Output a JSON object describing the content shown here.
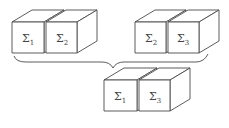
{
  "diagram": {
    "stroke_color": "#4a4a4a",
    "background": "#ffffff",
    "groups": [
      {
        "name": "top-left-pair",
        "cubes": [
          {
            "label": "Σ",
            "subscript": "1"
          },
          {
            "label": "Σ",
            "subscript": "2"
          }
        ]
      },
      {
        "name": "top-right-pair",
        "cubes": [
          {
            "label": "Σ",
            "subscript": "2"
          },
          {
            "label": "Σ",
            "subscript": "3"
          }
        ]
      },
      {
        "name": "bottom-pair",
        "cubes": [
          {
            "label": "Σ",
            "subscript": "1"
          },
          {
            "label": "Σ",
            "subscript": "3"
          }
        ]
      }
    ],
    "connector": "curly-brace joining the two top pairs down into the bottom pair"
  }
}
